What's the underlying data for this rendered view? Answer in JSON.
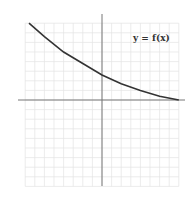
{
  "chart_data": {
    "type": "line",
    "title": "",
    "annotation": "y = f(x)",
    "xlabel": "",
    "ylabel": "",
    "grid": true,
    "xlim": [
      -8,
      8
    ],
    "ylim": [
      -9,
      8
    ],
    "series": [
      {
        "name": "y = f(x)",
        "description": "decreasing convex curve approaching x-axis",
        "x": [
          -7.6,
          -6,
          -4,
          -2,
          0,
          2,
          4,
          6,
          8
        ],
        "y": [
          8.0,
          6.6,
          5.0,
          3.8,
          2.6,
          1.7,
          1.0,
          0.4,
          0.0
        ]
      }
    ],
    "colors": {
      "curve": "#333333",
      "axes": "#777777",
      "grid": "#e4e4e4"
    }
  },
  "label": {
    "text": "y = f(x)"
  }
}
